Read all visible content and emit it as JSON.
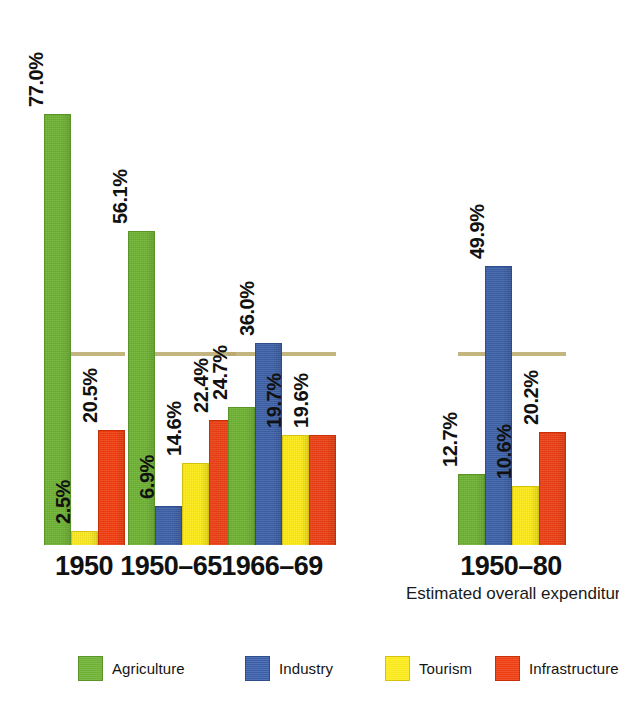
{
  "chart_data": {
    "type": "bar",
    "title": "",
    "subtitle": "",
    "xlabel": "",
    "ylabel": "",
    "ylim": [
      0,
      80
    ],
    "grid": false,
    "legend_position": "bottom",
    "value_suffix": "%",
    "categories": [
      "1950",
      "1950–65",
      "1966–69",
      "1950–80"
    ],
    "category_sublabels": [
      "",
      "",
      "",
      "Estimated overall expenditure"
    ],
    "series": [
      {
        "name": "Agriculture",
        "color": "#6db033",
        "values": [
          77.0,
          56.1,
          24.7,
          12.7
        ]
      },
      {
        "name": "Industry",
        "color": "#3a5fa8",
        "values": [
          null,
          6.9,
          36.0,
          49.9
        ]
      },
      {
        "name": "Tourism",
        "color": "#fbe919",
        "values": [
          2.5,
          14.6,
          19.7,
          10.6
        ]
      },
      {
        "name": "Infrastructure",
        "color": "#ee3d10",
        "values": [
          20.5,
          22.4,
          19.6,
          20.2
        ]
      }
    ],
    "value_labels": [
      [
        "77.0%",
        "56.1%",
        "24.7%",
        "12.7%"
      ],
      [
        "",
        "6.9%",
        "36.0%",
        "49.9%"
      ],
      [
        "2.5%",
        "14.6%",
        "19.7%",
        "10.6%"
      ],
      [
        "20.5%",
        "22.4%",
        "19.6%",
        "20.2%"
      ]
    ]
  },
  "legend": {
    "items": [
      {
        "label": "Agriculture",
        "swatch": "green"
      },
      {
        "label": "Industry",
        "swatch": "blue"
      },
      {
        "label": "Tourism",
        "swatch": "yellow"
      },
      {
        "label": "Infrastructure",
        "swatch": "red"
      }
    ]
  },
  "axis": {
    "labels": [
      {
        "main": "1950",
        "sub": ""
      },
      {
        "main": "1950–65",
        "sub": ""
      },
      {
        "main": "1966–69",
        "sub": ""
      },
      {
        "main": "1950–80",
        "sub": "Estimated overall expenditure"
      }
    ]
  },
  "layout": {
    "baseline_y": 535,
    "px_per_percent": 5.6,
    "bar_width": 27,
    "group_x": [
      44,
      128,
      228,
      458
    ],
    "group_center_x": [
      84,
      171,
      272,
      511
    ],
    "legend_x": [
      78,
      245,
      385,
      495
    ]
  }
}
